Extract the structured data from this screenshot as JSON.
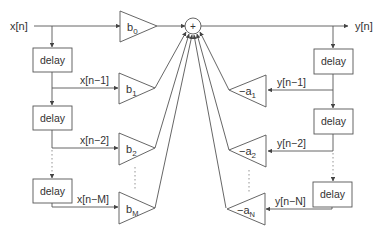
{
  "diagram": {
    "input_label": "x[n]",
    "output_label": "y[n]",
    "sum_symbol": "+",
    "delay_label": "delay",
    "feedforward": {
      "taps": [
        {
          "signal": "",
          "gain": "b",
          "sub": "0"
        },
        {
          "signal": "x[n−1]",
          "gain": "b",
          "sub": "1"
        },
        {
          "signal": "x[n−2]",
          "gain": "b",
          "sub": "2"
        },
        {
          "signal": "x[n−M]",
          "gain": "b",
          "sub": "M"
        }
      ]
    },
    "feedback": {
      "taps": [
        {
          "signal": "y[n−1]",
          "gain": "−a",
          "sub": "1"
        },
        {
          "signal": "y[n−2]",
          "gain": "−a",
          "sub": "2"
        },
        {
          "signal": "y[n−N]",
          "gain": "−a",
          "sub": "N"
        }
      ]
    },
    "colors": {
      "stroke": "#555555",
      "text": "#333333",
      "dotted": "#888888"
    }
  }
}
